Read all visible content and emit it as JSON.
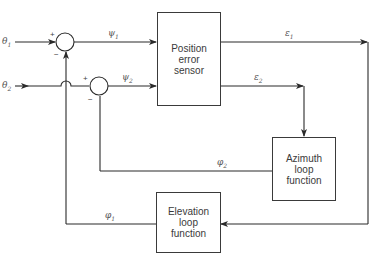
{
  "diagram": {
    "type": "block-diagram",
    "blocks": [
      {
        "id": "pes",
        "lines": [
          "Position",
          "error",
          "sensor"
        ]
      },
      {
        "id": "azimuth",
        "lines": [
          "Azimuth",
          "loop",
          "function"
        ]
      },
      {
        "id": "elevation",
        "lines": [
          "Elevation",
          "loop",
          "function"
        ]
      }
    ],
    "inputs": {
      "theta1": {
        "sym": "θ",
        "sub": "1"
      },
      "theta2": {
        "sym": "θ",
        "sub": "2"
      }
    },
    "signals": {
      "psi1": {
        "sym": "ψ",
        "sub": "1"
      },
      "psi2": {
        "sym": "ψ",
        "sub": "2"
      },
      "eps1": {
        "sym": "ε",
        "sub": "1"
      },
      "eps2": {
        "sym": "ε",
        "sub": "2"
      },
      "phi1": {
        "sym": "φ",
        "sub": "1"
      },
      "phi2": {
        "sym": "φ",
        "sub": "2"
      }
    },
    "summing_junctions": [
      {
        "id": "sum1",
        "plus": "+",
        "minus": "−"
      },
      {
        "id": "sum2",
        "plus": "+",
        "minus": "−"
      }
    ]
  }
}
